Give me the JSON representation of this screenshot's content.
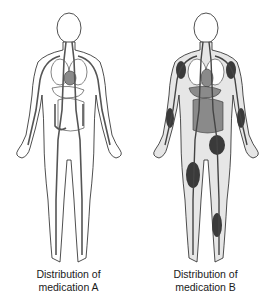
{
  "figures": [
    {
      "id": "A",
      "caption_line1": "Distribution of",
      "caption_line2": "medication A",
      "body_fill": "#ffffff",
      "organ_fill": "#ffffff",
      "vessel_color": "#555555",
      "muscle_deposits": false
    },
    {
      "id": "B",
      "caption_line1": "Distribution of",
      "caption_line2": "medication B",
      "body_fill": "#e6e6e6",
      "organ_fill": "#8a8a8a",
      "vessel_color": "#444444",
      "muscle_deposits": true
    }
  ],
  "colors": {
    "outline": "#222222",
    "muscle_dark": "#3a3a3a",
    "background": "#ffffff"
  }
}
